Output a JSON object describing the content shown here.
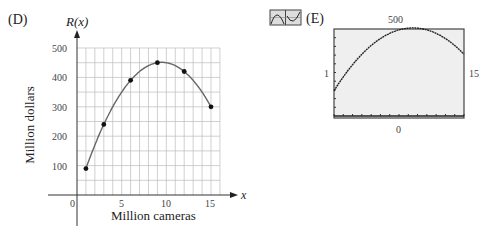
{
  "panel_d": {
    "label": "(D)",
    "y_axis_title": "R(x)",
    "y_label": "Million dollars",
    "x_label": "Million cameras",
    "x_axis_symbol": "x",
    "x_ticks": [
      "0",
      "5",
      "10",
      "15"
    ],
    "y_ticks": [
      "100",
      "200",
      "300",
      "400",
      "500"
    ]
  },
  "panel_e": {
    "label": "(E)",
    "icon": "graphing-calculator-icon",
    "window_top": "500",
    "window_bottom": "0",
    "window_left": "1",
    "window_right": "15"
  },
  "chart_data": [
    {
      "type": "scatter",
      "title": "(D)",
      "xlabel": "Million cameras",
      "ylabel": "Million dollars",
      "y_axis_name": "R(x)",
      "x": [
        1,
        3,
        6,
        9,
        12,
        15
      ],
      "y": [
        90,
        240,
        390,
        450,
        420,
        300
      ],
      "fit_curve": "quadratic regression through points",
      "xlim": [
        0,
        16
      ],
      "ylim": [
        0,
        500
      ],
      "grid": true,
      "x_ticks": [
        0,
        5,
        10,
        15
      ],
      "y_ticks": [
        100,
        200,
        300,
        400,
        500
      ]
    },
    {
      "type": "line",
      "title": "(E)",
      "description": "Graphing calculator window showing quadratic regression curve",
      "xlim": [
        1,
        15
      ],
      "ylim": [
        0,
        500
      ],
      "x": [
        1,
        3,
        6,
        9,
        10,
        12,
        15
      ],
      "y": [
        150,
        260,
        380,
        440,
        445,
        425,
        320
      ]
    }
  ]
}
